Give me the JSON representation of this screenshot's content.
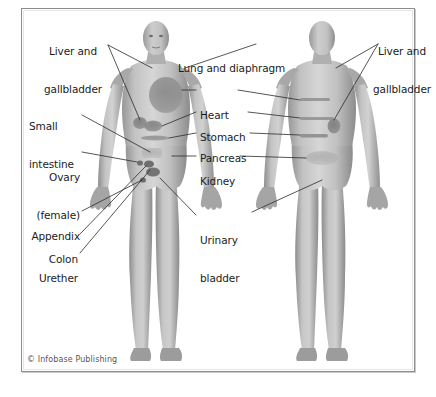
{
  "figure": {
    "copyright": "© Infobase Publishing",
    "caption": "",
    "background_color": "#ffffff",
    "frame_border_color": "#8d8d8d",
    "body_fill_color": "#b4b4b4",
    "organ_shade_color": "#8f8f8f",
    "leader_line_color": "#2b2b2b",
    "text_color": "#1b1b1b"
  },
  "views": [
    {
      "name": "anterior-view",
      "label": "front view"
    },
    {
      "name": "posterior-view",
      "label": "back view"
    }
  ],
  "labels": {
    "liver_gallbladder_left": {
      "line1": "Liver and",
      "line2": "gallbladder"
    },
    "lung_diaphragm": {
      "line1": "Lung and diaphragm"
    },
    "liver_gallbladder_right": {
      "line1": "Liver and",
      "line2": "gallbladder"
    },
    "small_intestine": {
      "line1": "Small",
      "line2": "intestine"
    },
    "heart": {
      "line1": "Heart"
    },
    "stomach": {
      "line1": "Stomach"
    },
    "pancreas": {
      "line1": "Pancreas"
    },
    "ovary_female": {
      "line1": "Ovary",
      "line2": "(female)"
    },
    "kidney": {
      "line1": "Kidney"
    },
    "appendix": {
      "line1": "Appendix"
    },
    "colon": {
      "line1": "Colon"
    },
    "urether": {
      "line1": "Urether"
    },
    "urinary_bladder": {
      "line1": "Urinary",
      "line2": "bladder"
    }
  },
  "organ_markers": [
    {
      "name": "liver-marker-front",
      "view": "anterior",
      "shape": "oval"
    },
    {
      "name": "gallbladder-marker-front",
      "view": "anterior",
      "shape": "oval"
    },
    {
      "name": "lung-diaphragm-marker",
      "view": "anterior",
      "shape": "large-oval"
    },
    {
      "name": "stomach-marker",
      "view": "anterior",
      "shape": "oval"
    },
    {
      "name": "pancreas-marker",
      "view": "anterior",
      "shape": "band"
    },
    {
      "name": "small-intestine-marker",
      "view": "anterior",
      "shape": "patch"
    },
    {
      "name": "ovary-marker",
      "view": "anterior",
      "shape": "dot"
    },
    {
      "name": "colon-marker",
      "view": "anterior",
      "shape": "dot"
    },
    {
      "name": "appendix-marker",
      "view": "anterior",
      "shape": "dot"
    },
    {
      "name": "urinary-bladder-marker",
      "view": "anterior",
      "shape": "oval"
    },
    {
      "name": "urether-marker",
      "view": "anterior",
      "shape": "dot"
    },
    {
      "name": "heart-marker-back",
      "view": "posterior",
      "shape": "band"
    },
    {
      "name": "stomach-marker-back",
      "view": "posterior",
      "shape": "band"
    },
    {
      "name": "pancreas-marker-back",
      "view": "posterior",
      "shape": "band"
    },
    {
      "name": "kidney-marker-back",
      "view": "posterior",
      "shape": "patch"
    },
    {
      "name": "gallbladder-marker-back",
      "view": "posterior",
      "shape": "oval"
    }
  ]
}
